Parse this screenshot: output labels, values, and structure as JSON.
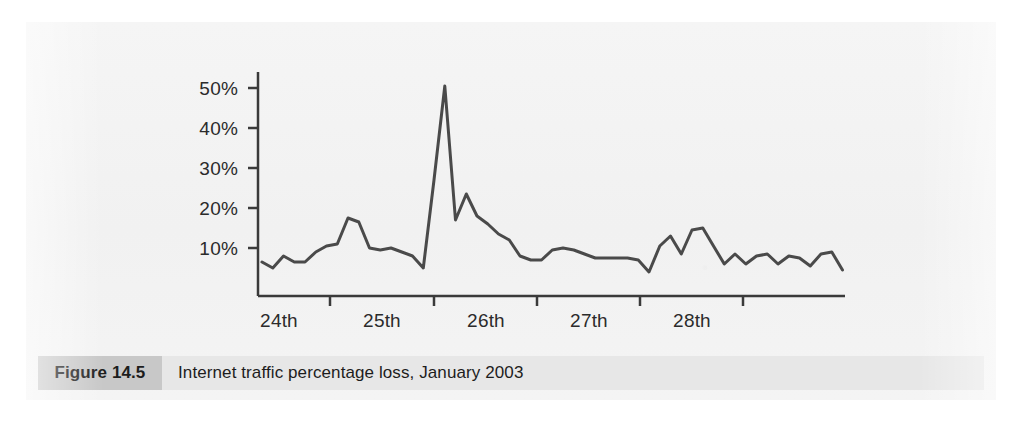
{
  "figure": {
    "tag": "Figure 14.5",
    "caption": "Internet traffic percentage loss, January 2003"
  },
  "colors": {
    "line": "#4a4a4a",
    "axis": "#3a3a3a",
    "page": "#f3f3f3",
    "caption_band": "#e7e7e7",
    "figure_tag_band": "#c8c8c8",
    "text": "#1d1d1d"
  },
  "chart_data": {
    "type": "line",
    "title": "Internet traffic percentage loss, January 2003",
    "xlabel": "",
    "ylabel": "",
    "grid": false,
    "legend": null,
    "ylim": [
      -2,
      55
    ],
    "ytick_labels": [
      "10%",
      "20%",
      "30%",
      "40%",
      "50%"
    ],
    "ytick_values": [
      10,
      20,
      30,
      40,
      50
    ],
    "xtick_labels": [
      "24th",
      "25th",
      "26th",
      "27th",
      "28th"
    ],
    "x_axis_note": "Tick marks mark day boundaries; day labels sit centred between ticks",
    "series": [
      {
        "name": "Internet traffic percentage loss",
        "values": [
          6.5,
          5.0,
          8.0,
          6.5,
          6.5,
          9.0,
          10.5,
          11.0,
          17.5,
          16.5,
          10.0,
          9.5,
          10.0,
          9.0,
          8.0,
          5.0,
          27.0,
          50.5,
          17.0,
          23.5,
          18.0,
          16.0,
          13.5,
          12.0,
          8.0,
          7.0,
          7.0,
          9.5,
          10.0,
          9.5,
          8.5,
          7.5,
          7.5,
          7.5,
          7.5,
          7.0,
          4.0,
          10.5,
          13.0,
          8.5,
          14.5,
          15.0,
          10.5,
          6.0,
          8.5,
          6.0,
          8.0,
          8.5,
          6.0,
          8.0,
          7.5,
          5.5,
          8.5,
          9.0,
          4.5
        ]
      }
    ]
  },
  "geometry": {
    "plot_left": 232,
    "plot_right": 819,
    "baseline_y": 274,
    "zero_y": 266,
    "px_per_percent": 4,
    "day_tick_x": [
      304,
      408,
      511,
      614,
      717
    ]
  }
}
